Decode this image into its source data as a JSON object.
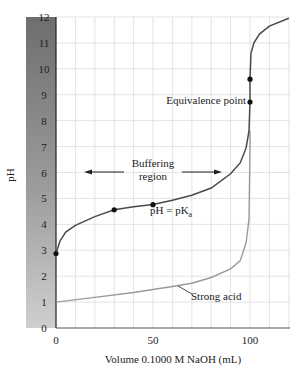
{
  "chart_data": {
    "type": "line",
    "title": "",
    "xlabel": "Volume 0.1000 M NaOH (mL)",
    "ylabel": "pH",
    "xlim": [
      0,
      120
    ],
    "ylim": [
      0,
      12
    ],
    "xticks": [
      0,
      50,
      100
    ],
    "yticks": [
      0,
      1,
      2,
      3,
      4,
      5,
      6,
      7,
      8,
      9,
      10,
      11,
      12
    ],
    "grid": true,
    "series": [
      {
        "name": "Weak acid",
        "color": "#4a4a4a",
        "x": [
          0,
          2,
          5,
          10,
          20,
          30,
          40,
          50,
          60,
          70,
          80,
          90,
          95,
          98,
          99.5,
          100,
          100,
          100.5,
          102,
          105,
          110,
          120
        ],
        "y": [
          2.87,
          3.35,
          3.7,
          3.96,
          4.3,
          4.56,
          4.68,
          4.76,
          4.93,
          5.12,
          5.4,
          5.95,
          6.38,
          6.95,
          7.6,
          8.72,
          9.6,
          10.6,
          11.0,
          11.35,
          11.65,
          11.95
        ]
      },
      {
        "name": "Strong acid",
        "color": "#9a9a9a",
        "x": [
          0,
          20,
          40,
          60,
          70,
          80,
          90,
          95,
          98,
          99.5,
          100
        ],
        "y": [
          1.0,
          1.18,
          1.37,
          1.6,
          1.73,
          1.95,
          2.28,
          2.6,
          3.3,
          4.2,
          7.0
        ]
      }
    ],
    "points": [
      {
        "x": 0,
        "y": 2.87
      },
      {
        "x": 30,
        "y": 4.56
      },
      {
        "x": 50,
        "y": 4.76
      },
      {
        "x": 100,
        "y": 8.72
      },
      {
        "x": 100,
        "y": 9.6
      }
    ],
    "annotations": [
      {
        "text": "Buffering",
        "line2": "region",
        "x": 50,
        "y": 6.2
      },
      {
        "text": "pH = pK",
        "subscript": "a",
        "x": 58,
        "y": 4.35
      },
      {
        "text": "Equivalence point",
        "x": 75,
        "y": 8.72
      },
      {
        "text": "Strong acid",
        "x": 75,
        "y": 1.0
      }
    ]
  },
  "labels": {
    "xlabel": "Volume 0.1000 M NaOH (mL)",
    "ylabel": "pH",
    "buffer1": "Buffering",
    "buffer2": "region",
    "pka_main": "pH = pK",
    "pka_sub": "a",
    "equiv": "Equivalence point",
    "strong": "Strong acid",
    "xt0": "0",
    "xt50": "50",
    "xt100": "100",
    "yt": [
      "0",
      "1",
      "2",
      "3",
      "4",
      "5",
      "6",
      "7",
      "8",
      "9",
      "10",
      "11",
      "12"
    ]
  }
}
